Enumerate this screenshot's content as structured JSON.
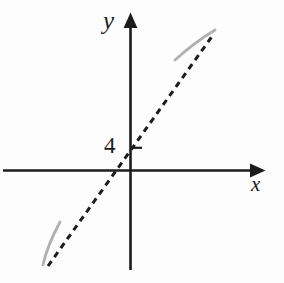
{
  "figure": {
    "colors": {
      "background": "#fdfdfd",
      "ink": "#1c1c1c",
      "curve_gray": "#b1b1b1"
    },
    "axes": {
      "x_label": "x",
      "y_label": "y"
    },
    "y_tick": {
      "label": "4",
      "value": 4
    },
    "asymptote": {
      "style": "dashed",
      "dash_pattern": "6 5",
      "y_intercept": 4,
      "slope_sign": "positive"
    },
    "curve_segments": {
      "count": 2,
      "positions": [
        "upper-right",
        "lower-left"
      ]
    }
  }
}
